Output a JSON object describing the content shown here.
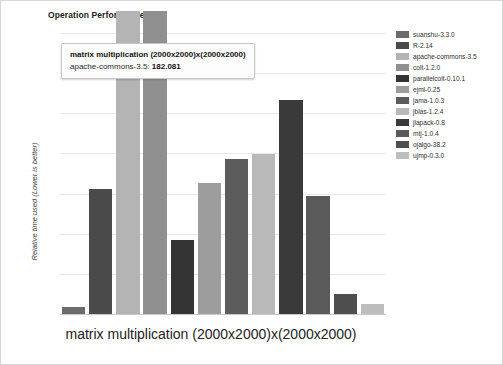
{
  "chart_title": "Operation Performance",
  "xlabel": "matrix multiplication (2000x2000)x(2000x2000)",
  "ylabel": "Relative time used (Lower is better)",
  "tooltip": {
    "title": "matrix multiplication (2000x2000)x(2000x2000)",
    "series_label": "apache-commons-3.5:",
    "value": "182.081"
  },
  "legend": {
    "items": [
      {
        "label": "suanshu-3.3.0",
        "color": "#6b6b6b"
      },
      {
        "label": "R-2.14",
        "color": "#4a4a4a"
      },
      {
        "label": "apache-commons-3.5",
        "color": "#b4b4b4"
      },
      {
        "label": "colt-1.2.0",
        "color": "#909090"
      },
      {
        "label": "parallelcolt-0.10.1",
        "color": "#343434"
      },
      {
        "label": "ejml-0.25",
        "color": "#9d9d9d"
      },
      {
        "label": "jama-1.0.3",
        "color": "#5c5c5c"
      },
      {
        "label": "jblas-1.2.4",
        "color": "#b9b9b9"
      },
      {
        "label": "jlapack-0.8",
        "color": "#3a3a3a"
      },
      {
        "label": "mtj-1.0.4",
        "color": "#5a5a5a"
      },
      {
        "label": "ojalgo-38.2",
        "color": "#4e4e4e"
      },
      {
        "label": "ujmp-0.3.0",
        "color": "#bdbdbd"
      }
    ]
  },
  "chart_data": {
    "type": "bar",
    "title": "Operation Performance",
    "xlabel": "matrix multiplication (2000x2000)x(2000x2000)",
    "ylabel": "Relative time used (Lower is better)",
    "grid": true,
    "legend_position": "right",
    "ylim": [
      0,
      100
    ],
    "categories": [
      "suanshu-3.3.0",
      "R-2.14",
      "apache-commons-3.5",
      "colt-1.2.0",
      "parallelcolt-0.10.1",
      "ejml-0.25",
      "jama-1.0.3",
      "jblas-1.2.4",
      "jlapack-0.8",
      "mtj-1.0.4",
      "ojalgo-38.2",
      "ujmp-0.3.0"
    ],
    "values": [
      2.5,
      44.5,
      112,
      112,
      26.5,
      46.5,
      55,
      57,
      76,
      42,
      7,
      3.5
    ],
    "clipped_above_axis": [
      "apache-commons-3.5",
      "colt-1.2.0"
    ],
    "highlighted_point": {
      "series": "apache-commons-3.5",
      "value": "182.081"
    },
    "colors": [
      "#6b6b6b",
      "#4a4a4a",
      "#b4b4b4",
      "#909090",
      "#343434",
      "#9d9d9d",
      "#5c5c5c",
      "#b9b9b9",
      "#3a3a3a",
      "#5a5a5a",
      "#4e4e4e",
      "#bdbdbd"
    ]
  }
}
